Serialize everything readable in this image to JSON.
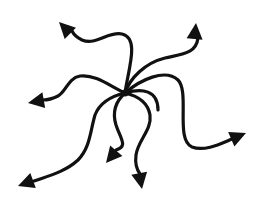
{
  "diagram": {
    "title": "Radiating arrows",
    "width": 258,
    "height": 206,
    "background": "#ffffff",
    "ink": "#111111",
    "stroke_width": 3.2,
    "hub": {
      "x": 125,
      "y": 93,
      "r": 3.5
    },
    "arrows": [
      {
        "name": "arrow-upper-left",
        "path": "M125,93 C128,70 140,38 122,34 C108,31 96,46 82,40 C76,37 73,33 72,31",
        "head": {
          "tip": [
            59,
            22
          ],
          "angle": 225
        }
      },
      {
        "name": "arrow-upper-right",
        "path": "M125,93 C130,78 145,63 165,58 C182,54 196,54 198,38",
        "head": {
          "tip": [
            196,
            23
          ],
          "angle": 275
        }
      },
      {
        "name": "arrow-left",
        "path": "M125,93 C110,86 95,74 80,76 C68,78 66,92 58,96 C52,99 47,100 43,100",
        "head": {
          "tip": [
            28,
            103
          ],
          "angle": 170
        }
      },
      {
        "name": "arrow-right",
        "path": "M125,93 C140,80 165,68 178,80 C190,92 175,140 192,147 C205,152 222,143 232,139",
        "head": {
          "tip": [
            246,
            133
          ],
          "angle": 337
        }
      },
      {
        "name": "arrow-lower-left",
        "path": "M125,93 C112,96 100,102 95,115 C90,132 90,148 78,160 C65,172 48,176 34,181",
        "head": {
          "tip": [
            18,
            186
          ],
          "angle": 160
        }
      },
      {
        "name": "arrow-lower-center",
        "path": "M125,93 C115,102 112,112 116,125 C121,140 128,146 116,150",
        "head": {
          "tip": [
            106,
            163
          ],
          "angle": 130
        }
      },
      {
        "name": "arrow-lower-right",
        "path": "M125,93 C138,96 148,103 150,115 C152,130 138,140 136,155 C135,163 137,170 140,174",
        "head": {
          "tip": [
            142,
            189
          ],
          "angle": 80
        }
      },
      {
        "name": "arrow-center-right-short",
        "path": "M125,93 C142,88 158,90 158,110",
        "head": null
      }
    ]
  }
}
